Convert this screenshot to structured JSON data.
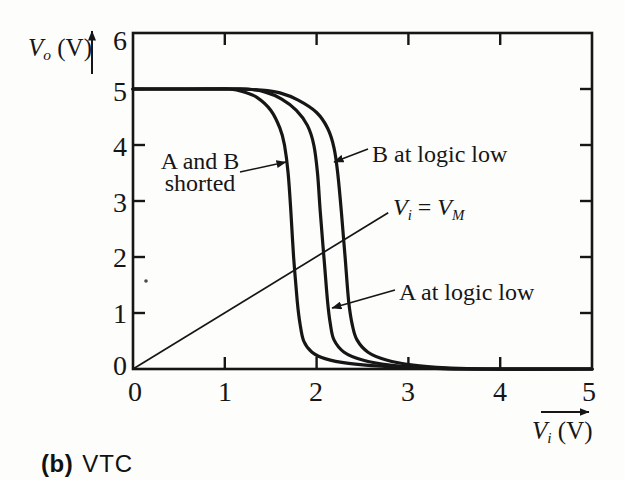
{
  "figure": {
    "background": "#fdfdfb",
    "ink": "#161616",
    "caption": {
      "prefix": "(b)",
      "label": "VTC"
    }
  },
  "chart_data": {
    "type": "line",
    "title": "",
    "xlabel": "Vi (V)",
    "ylabel": "Vo (V)",
    "xlabel_parts": [
      {
        "t": "V",
        "it": true
      },
      {
        "t": "i",
        "sub": true
      },
      {
        "t": " (V)"
      }
    ],
    "ylabel_parts": [
      {
        "t": "V",
        "it": true
      },
      {
        "t": "o",
        "sub": true
      },
      {
        "t": " (V)"
      }
    ],
    "xlim": [
      0,
      5
    ],
    "ylim": [
      0,
      6
    ],
    "x_ticks": [
      0,
      1,
      2,
      3,
      4,
      5
    ],
    "y_ticks": [
      0,
      1,
      2,
      3,
      4,
      5,
      6
    ],
    "tick_marks": {
      "bottom": [
        1,
        2,
        3,
        4
      ],
      "top": [
        1,
        2,
        3,
        4
      ],
      "left": [
        1,
        2,
        3,
        4,
        5
      ],
      "right": [
        1,
        2,
        3,
        4,
        5
      ]
    },
    "grid": false,
    "series": [
      {
        "name": "A and B shorted",
        "points": [
          [
            0,
            5
          ],
          [
            0.5,
            5
          ],
          [
            0.9,
            5
          ],
          [
            1.05,
            5
          ],
          [
            1.2,
            4.95
          ],
          [
            1.35,
            4.85
          ],
          [
            1.5,
            4.62
          ],
          [
            1.6,
            4.3
          ],
          [
            1.65,
            4.0
          ],
          [
            1.69,
            3.5
          ],
          [
            1.72,
            2.8
          ],
          [
            1.75,
            2.0
          ],
          [
            1.79,
            1.2
          ],
          [
            1.82,
            0.8
          ],
          [
            1.86,
            0.5
          ],
          [
            1.95,
            0.3
          ],
          [
            2.1,
            0.18
          ],
          [
            2.35,
            0.1
          ],
          [
            2.7,
            0.05
          ],
          [
            3.1,
            0.02
          ],
          [
            3.6,
            0
          ],
          [
            5,
            0
          ]
        ]
      },
      {
        "name": "A at logic low",
        "points": [
          [
            0,
            5
          ],
          [
            0.6,
            5
          ],
          [
            1.0,
            5
          ],
          [
            1.25,
            5
          ],
          [
            1.45,
            4.94
          ],
          [
            1.62,
            4.82
          ],
          [
            1.78,
            4.62
          ],
          [
            1.9,
            4.35
          ],
          [
            1.97,
            4.0
          ],
          [
            2.01,
            3.5
          ],
          [
            2.04,
            2.8
          ],
          [
            2.08,
            2.0
          ],
          [
            2.12,
            1.2
          ],
          [
            2.15,
            0.8
          ],
          [
            2.19,
            0.52
          ],
          [
            2.3,
            0.3
          ],
          [
            2.5,
            0.16
          ],
          [
            2.8,
            0.07
          ],
          [
            3.2,
            0.02
          ],
          [
            3.65,
            0
          ],
          [
            5,
            0
          ]
        ]
      },
      {
        "name": "B at logic low",
        "points": [
          [
            0,
            5
          ],
          [
            0.6,
            5
          ],
          [
            1.1,
            5
          ],
          [
            1.4,
            4.98
          ],
          [
            1.6,
            4.93
          ],
          [
            1.8,
            4.8
          ],
          [
            2.0,
            4.58
          ],
          [
            2.12,
            4.3
          ],
          [
            2.19,
            3.95
          ],
          [
            2.23,
            3.5
          ],
          [
            2.27,
            2.8
          ],
          [
            2.31,
            2.0
          ],
          [
            2.35,
            1.2
          ],
          [
            2.39,
            0.78
          ],
          [
            2.44,
            0.52
          ],
          [
            2.56,
            0.3
          ],
          [
            2.76,
            0.16
          ],
          [
            3.05,
            0.07
          ],
          [
            3.42,
            0.02
          ],
          [
            3.85,
            0
          ],
          [
            5,
            0
          ]
        ]
      }
    ],
    "unity_line": {
      "name": "Vi = VM",
      "from": [
        0,
        0
      ],
      "to": [
        2.78,
        2.79
      ]
    },
    "annotations": [
      {
        "id": "a-and-b-shorted",
        "lines": [
          "A and B",
          "shorted"
        ],
        "align": "center",
        "x": 200,
        "y": 172,
        "arrow": {
          "x1": 240,
          "y1": 172,
          "x2": 286,
          "y2": 162
        }
      },
      {
        "id": "b-at-logic-low",
        "lines": [
          "B at logic low"
        ],
        "align": "left",
        "x": 372,
        "y": 154,
        "arrow": {
          "x1": 368,
          "y1": 149,
          "x2": 334,
          "y2": 162
        }
      },
      {
        "id": "vi-equals-vm",
        "rich": [
          {
            "t": "V",
            "it": true
          },
          {
            "t": "i",
            "sub": true
          },
          {
            "t": " = "
          },
          {
            "t": "V",
            "it": true
          },
          {
            "t": "M",
            "sub": true
          }
        ],
        "align": "left",
        "x": 393,
        "y": 211
      },
      {
        "id": "a-at-logic-low",
        "lines": [
          "A at logic low"
        ],
        "align": "left",
        "x": 399,
        "y": 292,
        "arrow": {
          "x1": 395,
          "y1": 290,
          "x2": 332,
          "y2": 308
        }
      }
    ],
    "layout": {
      "plot": {
        "left": 133,
        "top": 33,
        "right": 592,
        "bottom": 369
      },
      "tick_len": 12,
      "x_label_centers": [
        135,
        225,
        316,
        408,
        500,
        589
      ],
      "x_label_center_y": 392,
      "y_label_right": 127,
      "y_label_centers": [
        366,
        314,
        258,
        203,
        147,
        92,
        41
      ],
      "y_axis_label_pos": {
        "x": 28,
        "y": 49
      },
      "x_axis_label_pos": {
        "x": 532,
        "y": 432
      },
      "y_axis_arrow": {
        "x": 92,
        "y1": 74,
        "y2": 31
      },
      "x_axis_arrow": {
        "x1": 541,
        "x2": 589,
        "y": 412
      },
      "caption_pos": {
        "x": 41,
        "y": 464
      },
      "artifact_dot": {
        "x": 146,
        "y": 281
      }
    }
  }
}
